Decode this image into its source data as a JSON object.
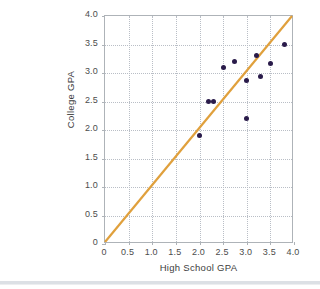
{
  "figure": {
    "top_artifact_text": "",
    "background_color": "#ffffff"
  },
  "chart_data": {
    "type": "scatter",
    "title": "",
    "xlabel": "High School GPA",
    "ylabel": "College GPA",
    "xlim": [
      0,
      4.0
    ],
    "ylim": [
      0,
      4.0
    ],
    "grid": true,
    "legend": "none",
    "xticks": [
      "0",
      "0.5",
      "1.0",
      "1.5",
      "2.0",
      "2.5",
      "3.0",
      "3.5",
      "4.0"
    ],
    "xtick_values": [
      0,
      0.5,
      1.0,
      1.5,
      2.0,
      2.5,
      3.0,
      3.5,
      4.0
    ],
    "yticks": [
      "0",
      "0.5",
      "1.0",
      "1.5",
      "2.0",
      "2.5",
      "3.0",
      "3.5",
      "4.0"
    ],
    "ytick_values": [
      0,
      0.5,
      1.0,
      1.5,
      2.0,
      2.5,
      3.0,
      3.5,
      4.0
    ],
    "point_color": "#2a1b4a",
    "x": [
      2.0,
      2.2,
      2.3,
      2.5,
      2.75,
      3.0,
      3.0,
      3.2,
      3.3,
      3.5,
      3.8
    ],
    "y": [
      1.9,
      2.5,
      2.5,
      3.1,
      3.2,
      2.2,
      2.87,
      3.3,
      2.93,
      3.17,
      3.5
    ],
    "points": [
      {
        "x": 2.0,
        "y": 1.9
      },
      {
        "x": 2.2,
        "y": 2.5
      },
      {
        "x": 2.3,
        "y": 2.5
      },
      {
        "x": 2.5,
        "y": 3.1
      },
      {
        "x": 2.75,
        "y": 3.2
      },
      {
        "x": 3.0,
        "y": 2.2
      },
      {
        "x": 3.0,
        "y": 2.87
      },
      {
        "x": 3.2,
        "y": 3.3
      },
      {
        "x": 3.3,
        "y": 2.93
      },
      {
        "x": 3.5,
        "y": 3.17
      },
      {
        "x": 3.8,
        "y": 3.5
      }
    ],
    "reference_line": {
      "name": "y = x",
      "color": "#e0a03c",
      "from": [
        0,
        0
      ],
      "to": [
        4.0,
        4.0
      ],
      "width": 2.2
    }
  }
}
